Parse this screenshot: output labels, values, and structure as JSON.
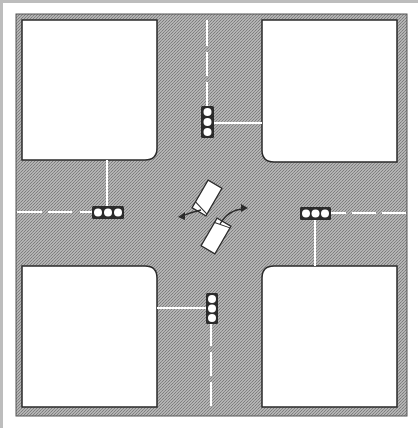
{
  "diagram": {
    "type": "road-intersection",
    "colors": {
      "road": "#a9a9a9",
      "road_texture": "#8e8e8e",
      "block": "#ffffff",
      "outline": "#2b2b2b",
      "lane_marking": "#ffffff",
      "signal_body": "#2b2b2b",
      "signal_lamp": "#ffffff",
      "frame": "#bdbdbd"
    },
    "blocks": [
      {
        "name": "top-left",
        "x": 22,
        "y": 20,
        "w": 135,
        "h": 140
      },
      {
        "name": "top-right",
        "x": 262,
        "y": 20,
        "w": 135,
        "h": 142
      },
      {
        "name": "bottom-left",
        "x": 22,
        "y": 266,
        "w": 135,
        "h": 141
      },
      {
        "name": "bottom-right",
        "x": 262,
        "y": 266,
        "w": 135,
        "h": 141
      }
    ],
    "signals": [
      {
        "name": "north",
        "orientation": "vertical",
        "x": 201,
        "y": 106,
        "lamps": 3
      },
      {
        "name": "west",
        "orientation": "horizontal",
        "x": 92,
        "y": 206,
        "lamps": 3
      },
      {
        "name": "east",
        "orientation": "horizontal",
        "x": 300,
        "y": 207,
        "lamps": 3
      },
      {
        "name": "south",
        "orientation": "vertical",
        "x": 206,
        "y": 293,
        "lamps": 3
      }
    ],
    "vehicles": [
      {
        "name": "vehicle-1",
        "cx": 207,
        "cy": 198,
        "angle": 30,
        "turn": "left"
      },
      {
        "name": "vehicle-2",
        "cx": 216,
        "cy": 236,
        "angle": 30,
        "turn": "right"
      }
    ]
  }
}
